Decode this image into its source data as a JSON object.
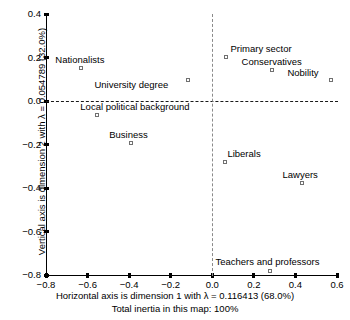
{
  "chart_data": {
    "type": "scatter",
    "title": "",
    "xlabel": "Horizontal axis is dimension 1 with λ = 0.116413 (68.0%)",
    "ylabel": "Vertical axis is dimension 2 with λ = 0.054789 (32.0%)",
    "footnote": "Total inertia in this map: 100%",
    "xlim": [
      -0.8,
      0.6
    ],
    "ylim": [
      -0.8,
      0.4
    ],
    "xticks": [
      "-0.8",
      "-0.6",
      "-0.4",
      "-0.2",
      "0.0",
      "0.2",
      "0.4",
      "0.6"
    ],
    "xtick_values": [
      -0.8,
      -0.6,
      -0.4,
      -0.2,
      0.0,
      0.2,
      0.4,
      0.6
    ],
    "yticks": [
      "0.4",
      "0.2",
      "0.0",
      "-0.2",
      "-0.4",
      "-0.6",
      "-0.8"
    ],
    "ytick_values": [
      0.4,
      0.2,
      0.0,
      -0.2,
      -0.4,
      -0.6,
      -0.8
    ],
    "grid": false,
    "legend": "none",
    "reference_lines": {
      "horizontal": 0.0,
      "vertical": 0.0
    },
    "marker_style": "open-square",
    "marker_color": "#707070",
    "points": [
      {
        "label": "Nationalists",
        "x": -0.63,
        "y": 0.15,
        "label_dx": -26,
        "label_dy": -13
      },
      {
        "label": "University degree",
        "x": -0.115,
        "y": 0.098,
        "label_dx": -94,
        "label_dy": 0
      },
      {
        "label": "Local political background",
        "x": -0.553,
        "y": -0.065,
        "label_dx": -17,
        "label_dy": -13
      },
      {
        "label": "Business",
        "x": -0.39,
        "y": -0.193,
        "label_dx": -22,
        "label_dy": -13
      },
      {
        "label": "Primary sector",
        "x": 0.068,
        "y": 0.202,
        "label_dx": 4,
        "label_dy": -13
      },
      {
        "label": "Conservatives",
        "x": 0.285,
        "y": 0.142,
        "label_dx": -30,
        "label_dy": -13
      },
      {
        "label": "Nobility",
        "x": 0.573,
        "y": 0.097,
        "label_dx": -44,
        "label_dy": -12
      },
      {
        "label": "Liberals",
        "x": 0.063,
        "y": -0.28,
        "label_dx": 2,
        "label_dy": -13
      },
      {
        "label": "Lawyers",
        "x": 0.434,
        "y": -0.377,
        "label_dx": -20,
        "label_dy": -13
      },
      {
        "label": "Teachers and professors",
        "x": 0.28,
        "y": -0.782,
        "label_dx": -55,
        "label_dy": -14
      }
    ]
  }
}
